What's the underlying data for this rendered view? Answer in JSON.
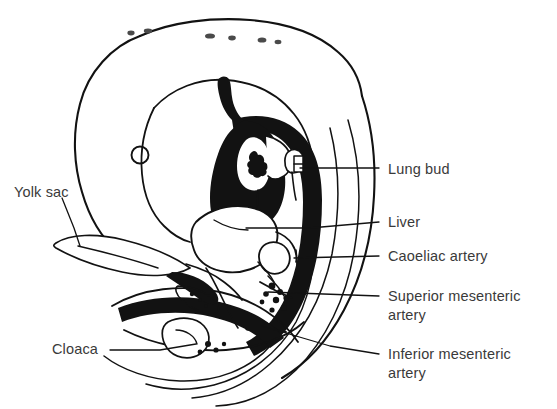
{
  "figure": {
    "kind": "anatomical-line-drawing",
    "background_color": "#ffffff",
    "ink_color": "#121212",
    "text_color": "#3a3a3a"
  },
  "labels": {
    "lung_bud": "Lung bud",
    "liver": "Liver",
    "coeliac_artery": "Caoeliac artery",
    "superior_mesenteric_artery": "Superior mesenteric\nartery",
    "inferior_mesenteric_artery": "Inferior mesenteric\nartery",
    "yolk_sac": "Yolk sac",
    "cloaca": "Cloaca"
  },
  "structures": {
    "eye": "eye-circle",
    "heart": "heart-mass-black",
    "dorsal_aorta": "dorsal-aorta-black-crescent",
    "liver_outline": "liver-lobe-outline",
    "gut_loop": "gut-loop",
    "yolk_stalk": "yolk-stalk",
    "tail": "tail-fold",
    "amnion": "amniotic-body-outline"
  }
}
